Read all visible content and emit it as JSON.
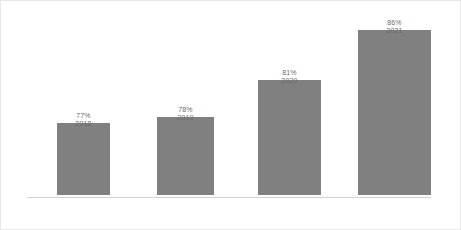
{
  "chart_data": {
    "type": "bar",
    "title": "",
    "subtitle": "",
    "xlabel": "",
    "ylabel": "",
    "categories": [
      "2018",
      "2019",
      "2020",
      "2021"
    ],
    "values": [
      77,
      78,
      81,
      86
    ],
    "value_labels": [
      "77%",
      "78%",
      "81%",
      "86%"
    ],
    "value_suffix": "%",
    "ylim": [
      75,
      88
    ],
    "grid": false,
    "legend": false,
    "legend_position": "none",
    "series": [
      {
        "name": "",
        "values": [
          77,
          78,
          81,
          86
        ]
      }
    ],
    "colors": {
      "bar": "#808080",
      "axis_line": "#d2d2d2",
      "label_text": "#6a6a6a",
      "background": "#ffffff",
      "border": "#e8e8e8"
    },
    "bar_geometry": [
      {
        "height_px": 72
      },
      {
        "height_px": 78
      },
      {
        "height_px": 115
      },
      {
        "height_px": 165
      }
    ]
  }
}
